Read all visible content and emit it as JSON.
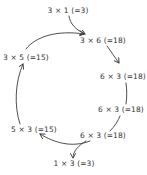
{
  "diagram": {
    "type": "cycle",
    "style": "hand-drawn",
    "colors": {
      "background": "#ffffff",
      "ink": "#333333"
    },
    "nodes": [
      {
        "id": "n1",
        "label": "3 × 1 (=3)",
        "x": 68,
        "y": 11
      },
      {
        "id": "n2",
        "label": "3 × 6 (=18)",
        "x": 103,
        "y": 41
      },
      {
        "id": "n3",
        "label": "6 × 3 (=18)",
        "x": 123,
        "y": 77
      },
      {
        "id": "n4",
        "label": "6 × 3 (=18)",
        "x": 121,
        "y": 110
      },
      {
        "id": "n5",
        "label": "6 × 3 (=18)",
        "x": 103,
        "y": 136
      },
      {
        "id": "n6",
        "label": "1 × 3 (=3)",
        "x": 74,
        "y": 164
      },
      {
        "id": "n7",
        "label": "5 × 3 (=15)",
        "x": 34,
        "y": 130
      },
      {
        "id": "n8",
        "label": "3 × 5 (=15)",
        "x": 26,
        "y": 58
      }
    ],
    "edges": [
      {
        "from": "n1",
        "to": "n2",
        "arrow": true
      },
      {
        "from": "n8",
        "to": "n2",
        "arrow": true
      },
      {
        "from": "n2",
        "to": "n3",
        "arrow": true
      },
      {
        "from": "n3",
        "to": "n4",
        "arrow": false
      },
      {
        "from": "n4",
        "to": "n5",
        "arrow": false
      },
      {
        "from": "n5",
        "to": "n7",
        "arrow": true
      },
      {
        "from": "n5",
        "to": "n6",
        "arrow": true
      },
      {
        "from": "n7",
        "to": "n8",
        "arrow": true
      }
    ]
  }
}
